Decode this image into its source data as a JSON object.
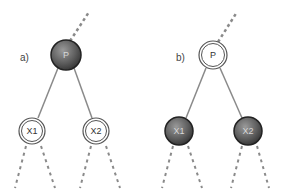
{
  "diagram": {
    "colors": {
      "edge": "#8a8a8a",
      "dashed_edge": "#8a8a8a",
      "filled_node": "#5a5a5a",
      "filled_node_text": "#d8d8d8",
      "hollow_node_stroke": "#555555",
      "hollow_node_text": "#333333"
    },
    "panels": [
      {
        "label": "a)",
        "parent": {
          "text": "P",
          "style": "filled"
        },
        "children": [
          {
            "text": "X1",
            "style": "hollow"
          },
          {
            "text": "X2",
            "style": "hollow"
          }
        ]
      },
      {
        "label": "b)",
        "parent": {
          "text": "P",
          "style": "hollow"
        },
        "children": [
          {
            "text": "X1",
            "style": "filled"
          },
          {
            "text": "X2",
            "style": "filled"
          }
        ]
      }
    ]
  }
}
